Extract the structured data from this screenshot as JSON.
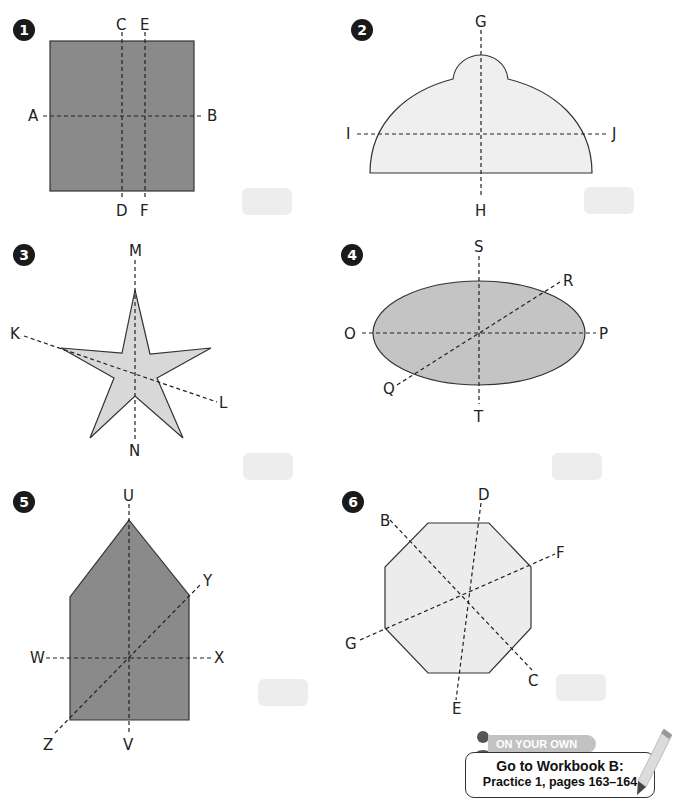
{
  "problems": [
    {
      "number": "1",
      "shape": "square",
      "fill": "#8a8a8a",
      "labels": {
        "A": "A",
        "B": "B",
        "C": "C",
        "D": "D",
        "E": "E",
        "F": "F"
      }
    },
    {
      "number": "2",
      "shape": "dome",
      "fill": "#efefef",
      "labels": {
        "G": "G",
        "H": "H",
        "I": "I",
        "J": "J"
      }
    },
    {
      "number": "3",
      "shape": "star",
      "fill": "#d8d8d8",
      "labels": {
        "K": "K",
        "L": "L",
        "M": "M",
        "N": "N"
      }
    },
    {
      "number": "4",
      "shape": "ellipse",
      "fill": "#c4c4c4",
      "labels": {
        "O": "O",
        "P": "P",
        "Q": "Q",
        "R": "R",
        "S": "S",
        "T": "T"
      }
    },
    {
      "number": "5",
      "shape": "pentagon",
      "fill": "#8a8a8a",
      "labels": {
        "U": "U",
        "V": "V",
        "W": "W",
        "X": "X",
        "Y": "Y",
        "Z": "Z"
      }
    },
    {
      "number": "6",
      "shape": "octagon",
      "fill": "#ececec",
      "labels": {
        "B": "B",
        "C": "C",
        "D": "D",
        "E": "E",
        "F": "F",
        "G": "G"
      }
    }
  ],
  "footer": {
    "banner": "ON YOUR OWN",
    "line1": "Go to Workbook B:",
    "line2": "Practice 1, pages 163–164"
  },
  "colors": {
    "badge": "#1a1a1a",
    "answer_box": "#ededed",
    "dashed_line": "#333333"
  }
}
